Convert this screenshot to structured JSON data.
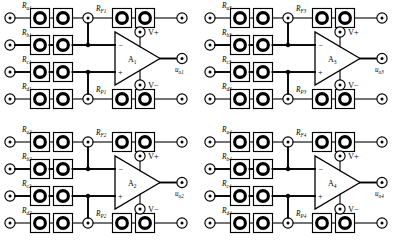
{
  "figure": {
    "type": "circuit-schematic",
    "background_color": "#ffffff",
    "line_color": "#000000",
    "grid": {
      "rows": 2,
      "cols": 2
    }
  },
  "circuits": [
    {
      "id": "circuit-1",
      "position": "top-left",
      "origin": {
        "x": 0,
        "y": 0
      },
      "opamp_label": "A",
      "opamp_index": "1",
      "inverting_sign": "−",
      "noninverting_sign": "+",
      "supply_positive": "V+",
      "supply_negative": "V−",
      "output_label": "u",
      "output_index": "o1",
      "input_resistors": [
        {
          "name": "R",
          "sub": "a1"
        },
        {
          "name": "R",
          "sub": "b1"
        },
        {
          "name": "R",
          "sub": "c1"
        },
        {
          "name": "R",
          "sub": "d1"
        }
      ],
      "feedback_resistor": {
        "name": "R",
        "sub": "F1"
      },
      "balance_resistor": {
        "name": "R",
        "sub": "P1"
      }
    },
    {
      "id": "circuit-3",
      "position": "top-right",
      "origin": {
        "x": 200,
        "y": 0
      },
      "opamp_label": "A",
      "opamp_index": "3",
      "inverting_sign": "−",
      "noninverting_sign": "+",
      "supply_positive": "V+",
      "supply_negative": "V−",
      "output_label": "u",
      "output_index": "o3",
      "input_resistors": [
        {
          "name": "R",
          "sub": "a3"
        },
        {
          "name": "R",
          "sub": "b3"
        },
        {
          "name": "R",
          "sub": "c3"
        },
        {
          "name": "R",
          "sub": "d3"
        }
      ],
      "feedback_resistor": {
        "name": "R",
        "sub": "F3"
      },
      "balance_resistor": {
        "name": "R",
        "sub": "P3"
      }
    },
    {
      "id": "circuit-2",
      "position": "bottom-left",
      "origin": {
        "x": 0,
        "y": 124
      },
      "opamp_label": "A",
      "opamp_index": "2",
      "inverting_sign": "−",
      "noninverting_sign": "+",
      "supply_positive": "V+",
      "supply_negative": "V−",
      "output_label": "u",
      "output_index": "o2",
      "input_resistors": [
        {
          "name": "R",
          "sub": "a2"
        },
        {
          "name": "R",
          "sub": "b2"
        },
        {
          "name": "R",
          "sub": "c2"
        },
        {
          "name": "R",
          "sub": "d2"
        }
      ],
      "feedback_resistor": {
        "name": "R",
        "sub": "F2"
      },
      "balance_resistor": {
        "name": "R",
        "sub": "P2"
      }
    },
    {
      "id": "circuit-4",
      "position": "bottom-right",
      "origin": {
        "x": 200,
        "y": 124
      },
      "opamp_label": "A",
      "opamp_index": "4",
      "inverting_sign": "−",
      "noninverting_sign": "+",
      "supply_positive": "V+",
      "supply_negative": "V−",
      "output_label": "u",
      "output_index": "o4",
      "input_resistors": [
        {
          "name": "R",
          "sub": "a4"
        },
        {
          "name": "R",
          "sub": "b4"
        },
        {
          "name": "R",
          "sub": "c4"
        },
        {
          "name": "R",
          "sub": "d4"
        }
      ],
      "feedback_resistor": {
        "name": "R",
        "sub": "F4"
      },
      "balance_resistor": {
        "name": "R",
        "sub": "P4"
      }
    }
  ]
}
